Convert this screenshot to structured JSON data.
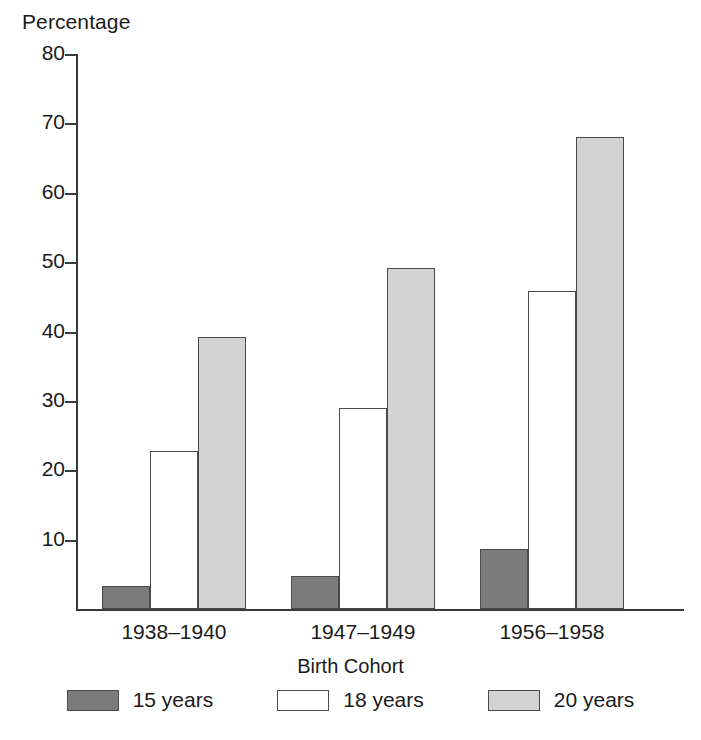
{
  "chart_data": {
    "type": "bar",
    "title": "",
    "subtitle": "",
    "xlabel": "Birth Cohort",
    "ylabel": "Percentage",
    "ylim": [
      0,
      80
    ],
    "yticks": [
      0,
      10,
      20,
      30,
      40,
      50,
      60,
      70,
      80
    ],
    "ytick_labels": [
      "",
      "10",
      "20",
      "30",
      "40",
      "50",
      "60",
      "70",
      "80"
    ],
    "grid": false,
    "legend_position": "bottom",
    "categories": [
      "1938–1940",
      "1947–1949",
      "1956–1958"
    ],
    "series": [
      {
        "name": "15 years",
        "color": "#7b7b7b",
        "values": [
          3.3,
          4.8,
          8.7
        ]
      },
      {
        "name": "18 years",
        "color": "#ffffff",
        "values": [
          22.8,
          29.0,
          45.8
        ]
      },
      {
        "name": "20 years",
        "color": "#d2d2d2",
        "values": [
          39.2,
          49.1,
          68.0
        ]
      }
    ],
    "annotations": []
  },
  "axes": {
    "y_title": "Percentage",
    "x_title": "Birth Cohort"
  },
  "colors": {
    "axis": "#3a3a3a",
    "bar_outline": "#4a4a4a",
    "series_15": "#7b7b7b",
    "series_18": "#ffffff",
    "series_20": "#d2d2d2",
    "background": "#ffffff"
  }
}
